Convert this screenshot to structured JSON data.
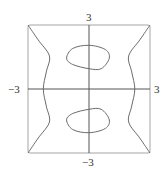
{
  "chart_data": {
    "type": "line",
    "title": "",
    "xlabel": "",
    "ylabel": "",
    "xlim": [
      -3,
      3
    ],
    "ylim": [
      -3,
      3
    ],
    "grid": false,
    "legend": null,
    "frame": "box",
    "axes_through_origin": true,
    "tick_labels": {
      "x_min": "−3",
      "x_max": "3",
      "y_max": "3",
      "y_min": "−3"
    },
    "series": [
      {
        "name": "left-branch",
        "description": "curve from top-left corner bulging inward, crossing x-axis near x=-2.25, to bottom-left corner",
        "points": [
          [
            -3,
            3
          ],
          [
            -2.5,
            2.3
          ],
          [
            -1.95,
            1.55
          ],
          [
            -2.1,
            0.8
          ],
          [
            -2.25,
            0
          ],
          [
            -2.1,
            -0.8
          ],
          [
            -1.95,
            -1.55
          ],
          [
            -2.5,
            -2.3
          ],
          [
            -3,
            -3
          ]
        ]
      },
      {
        "name": "right-branch",
        "description": "curve from top-right corner bulging inward, crossing x-axis near x=2.25, to bottom-right corner",
        "points": [
          [
            3,
            3
          ],
          [
            2.5,
            2.3
          ],
          [
            1.95,
            1.55
          ],
          [
            2.1,
            0.8
          ],
          [
            2.25,
            0
          ],
          [
            2.1,
            -0.8
          ],
          [
            1.95,
            -1.55
          ],
          [
            2.5,
            -2.3
          ],
          [
            3,
            -3
          ]
        ]
      },
      {
        "name": "upper-oval",
        "description": "closed loop centered near (0, 1.5)",
        "points": [
          [
            -1.1,
            1.45
          ],
          [
            -0.8,
            1.9
          ],
          [
            0,
            2.05
          ],
          [
            0.8,
            1.85
          ],
          [
            1.0,
            1.45
          ],
          [
            0.6,
            0.95
          ],
          [
            0,
            0.95
          ],
          [
            -0.8,
            1.15
          ],
          [
            -1.1,
            1.45
          ]
        ]
      },
      {
        "name": "lower-oval",
        "description": "closed loop centered near (0, -1.5)",
        "points": [
          [
            -1.1,
            -1.45
          ],
          [
            -0.8,
            -1.15
          ],
          [
            0,
            -0.95
          ],
          [
            0.6,
            -0.95
          ],
          [
            1.0,
            -1.45
          ],
          [
            0.8,
            -1.85
          ],
          [
            0,
            -2.05
          ],
          [
            -0.8,
            -1.9
          ],
          [
            -1.1,
            -1.45
          ]
        ]
      }
    ],
    "colors": {
      "curve": "#6b6b6b",
      "axes": "#555555",
      "frame": "#9a9a9a"
    }
  }
}
